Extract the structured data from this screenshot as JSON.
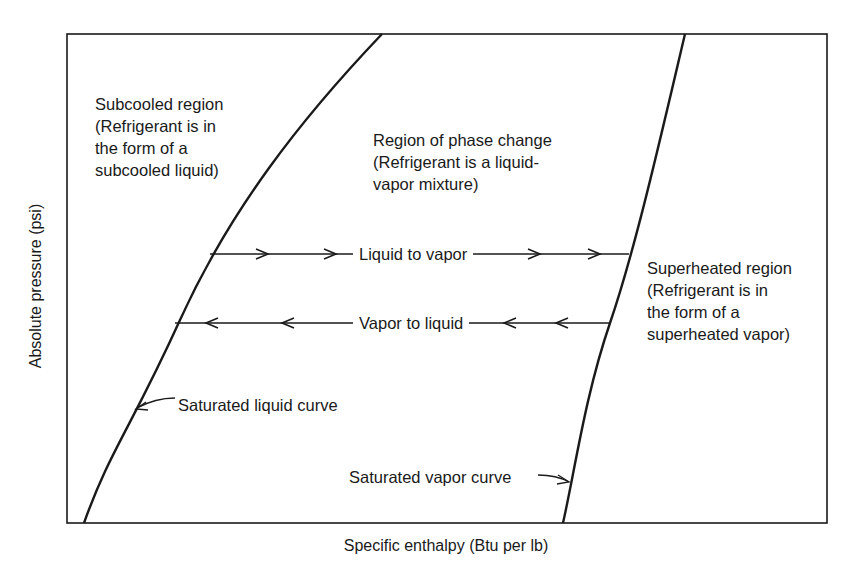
{
  "diagram": {
    "type": "pressure-enthalpy diagram",
    "axes": {
      "x_label": "Specific enthalpy (Btu per lb)",
      "y_label": "Absolute pressure (psi)"
    },
    "regions": {
      "subcooled": {
        "lines": [
          "Subcooled region",
          "(Refrigerant is in",
          "the form of a",
          "subcooled liquid)"
        ]
      },
      "phase_change": {
        "lines": [
          "Region of phase change",
          "(Refrigerant is a liquid-",
          "vapor mixture)"
        ]
      },
      "superheated": {
        "lines": [
          "Superheated region",
          "(Refrigerant is in",
          "the form of a",
          "superheated vapor)"
        ]
      }
    },
    "processes": {
      "liquid_to_vapor": "Liquid to vapor",
      "vapor_to_liquid": "Vapor to liquid"
    },
    "curves": {
      "saturated_liquid": "Saturated liquid curve",
      "saturated_vapor": "Saturated vapor curve"
    },
    "colors": {
      "line": "#1a1a1a",
      "background": "#ffffff"
    }
  }
}
